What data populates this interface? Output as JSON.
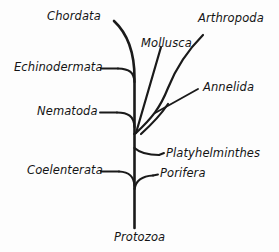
{
  "diagram": {
    "type": "cladogram",
    "background_color": "#fdfdfd",
    "line_color": "#1a1a1a",
    "root": "Protozoa"
  },
  "labels": {
    "chordata": "Chordata",
    "mollusca": "Mollusca",
    "arthropoda": "Arthropoda",
    "echinodermata": "Echinodermata",
    "annelida": "Annelida",
    "nematoda": "Nematoda",
    "platyhelminthes": "Platyhelminthes",
    "coelenterata": "Coelenterata",
    "porifera": "Porifera",
    "protozoa": "Protozoa"
  },
  "taxa": [
    {
      "name": "Chordata",
      "side": "left",
      "label_x": 47,
      "label_y": 11
    },
    {
      "name": "Mollusca",
      "side": "right",
      "label_x": 141,
      "label_y": 38
    },
    {
      "name": "Arthropoda",
      "side": "right",
      "label_x": 198,
      "label_y": 13
    },
    {
      "name": "Echinodermata",
      "side": "left",
      "label_x": 14,
      "label_y": 66
    },
    {
      "name": "Annelida",
      "side": "right",
      "label_x": 203,
      "label_y": 85
    },
    {
      "name": "Nematoda",
      "side": "left",
      "label_x": 37,
      "label_y": 110
    },
    {
      "name": "Platyhelminthes",
      "side": "right",
      "label_x": 166,
      "label_y": 148
    },
    {
      "name": "Coelenterata",
      "side": "left",
      "label_x": 27,
      "label_y": 168
    },
    {
      "name": "Porifera",
      "side": "right",
      "label_x": 160,
      "label_y": 170
    },
    {
      "name": "Protozoa",
      "side": "root",
      "label_x": 114,
      "label_y": 232
    }
  ]
}
